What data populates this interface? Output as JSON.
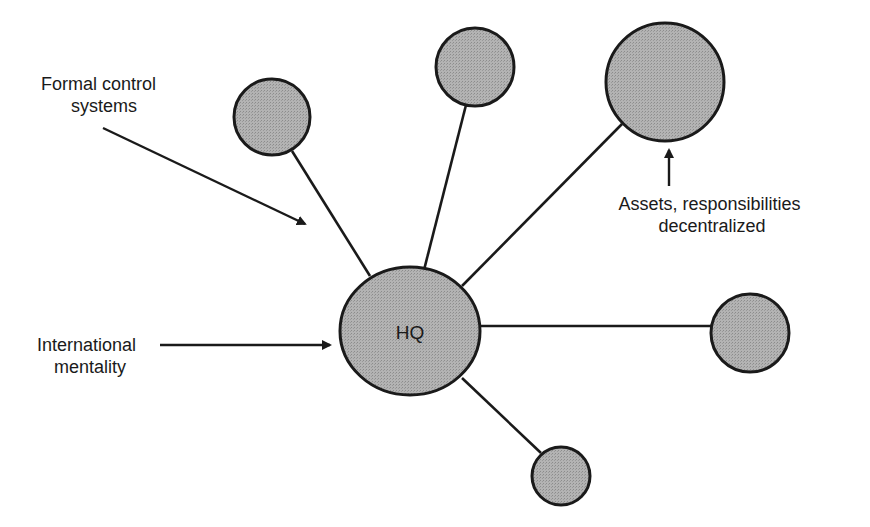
{
  "diagram": {
    "title": "",
    "colors": {
      "node_fill": "#a9a9a9",
      "stroke": "#1a1a1a",
      "background": "#ffffff"
    },
    "hub": {
      "id": "hq",
      "label": "HQ"
    },
    "satellites": [
      {
        "id": "sub-upper-left",
        "label": ""
      },
      {
        "id": "sub-top",
        "label": ""
      },
      {
        "id": "sub-upper-right",
        "label": ""
      },
      {
        "id": "sub-right",
        "label": ""
      },
      {
        "id": "sub-bottom",
        "label": ""
      }
    ],
    "annotations": {
      "formal_control": [
        "Formal control",
        "systems"
      ],
      "international_mentality": [
        "International",
        "mentality"
      ],
      "assets_decentralized": [
        "Assets, responsibilities",
        "decentralized"
      ]
    }
  }
}
